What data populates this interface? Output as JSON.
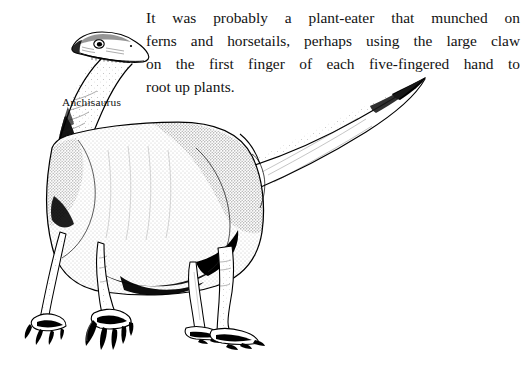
{
  "page": {
    "width": 530,
    "height": 369,
    "background_color": "#ffffff",
    "ink_color": "#000000"
  },
  "body_text": {
    "full_text": "It was probably a plant-eater that munched on ferns and horsetails, perhaps using the large claw on the first finger of each five-fingered hand to root up plants.",
    "alignment": "justified",
    "lines": [
      {
        "index": 0,
        "text": "It was probably a plant-eater that munched on",
        "justified": true,
        "words": [
          "It",
          "was",
          "probably",
          "a",
          "plant-eater",
          "that",
          "munched",
          "on"
        ]
      },
      {
        "index": 1,
        "text": "ferns and horsetails, perhaps using the large claw",
        "justified": true,
        "words": [
          "ferns",
          "and",
          "horsetails,",
          "perhaps",
          "using",
          "the",
          "large",
          "claw"
        ]
      },
      {
        "index": 2,
        "text": "on the first finger of each five-fingered hand to",
        "justified": true,
        "words": [
          "on",
          "the",
          "first",
          "finger",
          "of",
          "each",
          "five-fingered",
          "hand",
          "to"
        ]
      },
      {
        "index": 3,
        "text": "root up plants.",
        "justified": false,
        "words": [
          "root",
          "up",
          "plants."
        ]
      }
    ]
  },
  "figure": {
    "caption": "Anchisaurus",
    "style": "black-and-white stippled pen-and-ink illustration"
  }
}
